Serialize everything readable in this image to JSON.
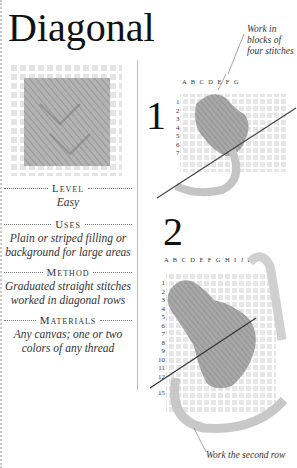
{
  "title": "Diagonal",
  "info": {
    "level": {
      "label": "Level",
      "value": "Easy"
    },
    "uses": {
      "label": "Uses",
      "value_line1": "Plain or striped filling or",
      "value_line2": "background for large areas"
    },
    "method": {
      "label": "Method",
      "value_line1": "Graduated straight stitches",
      "value_line2": "worked in diagonal rows"
    },
    "materials": {
      "label": "Materials",
      "value_line1": "Any canvas; one or two",
      "value_line2": "colors of any thread"
    }
  },
  "step1": {
    "number": "1",
    "column_letters": "A B C D E F G",
    "row_numbers": [
      "1",
      "2",
      "3",
      "4",
      "5",
      "6",
      "7"
    ],
    "annotation_line1": "Work in",
    "annotation_line2": "blocks of",
    "annotation_line3": "four stitches"
  },
  "step2": {
    "number": "2",
    "column_letters": "A B C D E F G H I J K",
    "row_numbers": [
      "1",
      "2",
      "3",
      "4",
      "5",
      "6",
      "7",
      "8",
      "9",
      "10",
      "11",
      "12",
      "",
      "15"
    ],
    "annotation": "Work the second row"
  },
  "colors": {
    "thread": "#9a9a9a",
    "canvas": "#e6e6e6",
    "text": "#222222"
  }
}
